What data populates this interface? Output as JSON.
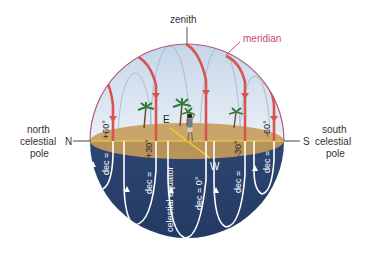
{
  "labels": {
    "zenith": "zenith",
    "meridian": "meridian",
    "north_pole": [
      "north",
      "celestial",
      "pole"
    ],
    "north_letter": "N",
    "south_pole": [
      "south",
      "celestial",
      "pole"
    ],
    "south_letter": "S",
    "east": "E",
    "west": "W",
    "celestial_equator": "celestial equator"
  },
  "declination_labels": {
    "plus60_upper": "+60°",
    "plus60_lower": "dec =",
    "plus30_upper": "+30°",
    "plus30_lower": "dec =",
    "zero": "dec = 0°",
    "minus30_upper": "-30°",
    "minus30_lower": "dec =",
    "minus60_upper": "-60°",
    "minus60_lower": "dec ="
  },
  "colors": {
    "sky_top": "#c9d9ea",
    "sky_bottom": "#e6eef6",
    "ground": "#c8a46a",
    "below_horizon": "#2c4470",
    "path_red": "#d9534f",
    "meridian_pink": "#c7457a",
    "outline": "#b45a7a",
    "horizon_yellow": "#f2d23a",
    "white_path": "#ffffff"
  }
}
